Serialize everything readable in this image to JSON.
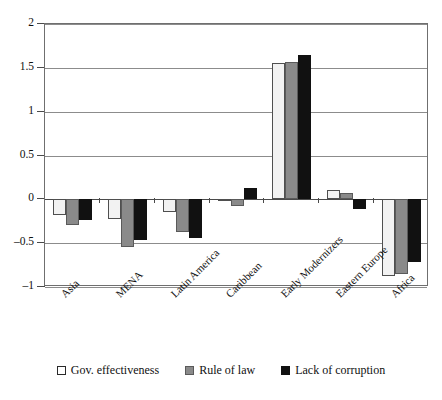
{
  "chart_data": {
    "type": "bar",
    "title": "",
    "subtitle": "",
    "xlabel": "",
    "ylabel": "",
    "ylim": [
      -1,
      2
    ],
    "yticks": [
      2,
      1.5,
      1,
      0.5,
      0,
      -0.5,
      -1
    ],
    "ytick_labels": [
      "2",
      "1.5",
      "1",
      "0.5",
      "0",
      "–0.5",
      "–1"
    ],
    "grid": true,
    "legend_position": "bottom",
    "categories": [
      "Asia",
      "MENA",
      "Latin America",
      "Caribbean",
      "Early Modernizers",
      "Eastern Europe",
      "Africa"
    ],
    "series": [
      {
        "name": "Gov. effectiveness",
        "color": "#f2f2f2",
        "values": [
          -0.18,
          -0.22,
          -0.15,
          -0.02,
          1.55,
          0.11,
          -0.87
        ]
      },
      {
        "name": "Rule of law",
        "color": "#8a8a8a",
        "values": [
          -0.29,
          -0.54,
          -0.37,
          -0.08,
          1.57,
          0.07,
          -0.85
        ]
      },
      {
        "name": "Lack of corruption",
        "color": "#111111",
        "values": [
          -0.24,
          -0.46,
          -0.44,
          0.13,
          1.65,
          -0.11,
          -0.72
        ]
      }
    ]
  },
  "legend": {
    "items": [
      {
        "label": "Gov. effectiveness",
        "swatch": "white-square-outline"
      },
      {
        "label": "Rule of law",
        "swatch": "gray-filled-square"
      },
      {
        "label": "Lack of corruption",
        "swatch": "black-filled-square"
      }
    ]
  }
}
